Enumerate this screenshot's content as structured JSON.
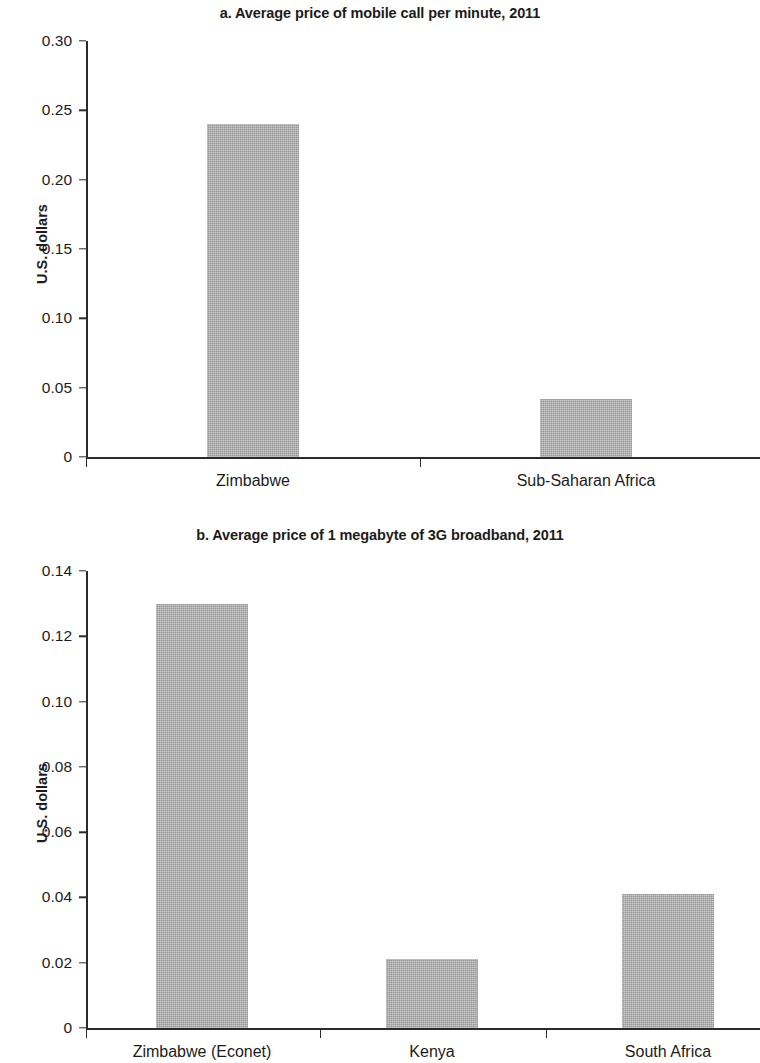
{
  "chart_data": [
    {
      "id": "a",
      "type": "bar",
      "title": "a. Average price of mobile call per minute, 2011",
      "xlabel": "",
      "ylabel": "U.S. dollars",
      "categories": [
        "Zimbabwe",
        "Sub-Saharan Africa"
      ],
      "values": [
        0.24,
        0.042
      ],
      "ylim": [
        0,
        0.3
      ],
      "ytick_values": [
        0,
        0.05,
        0.1,
        0.15,
        0.2,
        0.25,
        0.3
      ],
      "ytick_labels": [
        "0",
        "0.05",
        "0.10",
        "0.15",
        "0.20",
        "0.25",
        "0.30"
      ],
      "grid": false,
      "legend": "none",
      "bar_color": "#a9a9a9"
    },
    {
      "id": "b",
      "type": "bar",
      "title": "b. Average price of 1 megabyte of 3G broadband, 2011",
      "xlabel": "",
      "ylabel": "U.S. dollars",
      "categories": [
        "Zimbabwe (Econet)",
        "Kenya",
        "South Africa"
      ],
      "values": [
        0.13,
        0.021,
        0.041
      ],
      "ylim": [
        0,
        0.14
      ],
      "ytick_values": [
        0,
        0.02,
        0.04,
        0.06,
        0.08,
        0.1,
        0.12,
        0.14
      ],
      "ytick_labels": [
        "0",
        "0.02",
        "0.04",
        "0.06",
        "0.08",
        "0.10",
        "0.12",
        "0.14"
      ],
      "grid": false,
      "legend": "none",
      "bar_color": "#a9a9a9"
    }
  ]
}
